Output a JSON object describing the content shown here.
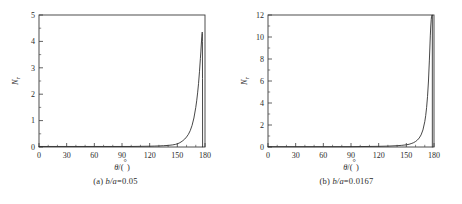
{
  "figure": {
    "background": "#ffffff",
    "line_color": "#262626",
    "axis_color": "#3a3a3a",
    "text_color": "#2b2b2b"
  },
  "panels": [
    {
      "id": "a",
      "caption_prefix": "(a)",
      "caption_expr": "b/a",
      "caption_eq": "=0.05",
      "caption_full": "(a) b/a=0.05"
    },
    {
      "id": "b",
      "caption_prefix": "(b)",
      "caption_expr": "b/a",
      "caption_eq": "=0.0167",
      "caption_full": "(b) b/a=0.0167"
    }
  ],
  "chart_data": [
    {
      "type": "line",
      "panel": "a",
      "title": "(a) b/a=0.05",
      "xlabel": "θ/(°)",
      "ylabel": "N",
      "ylabel_sub": "r",
      "xlim": [
        0,
        180
      ],
      "ylim": [
        0,
        5
      ],
      "xticks": [
        0,
        30,
        60,
        90,
        120,
        150,
        180
      ],
      "xtick_labels": [
        "0",
        "30",
        "60",
        "90",
        "120",
        "150",
        "180"
      ],
      "xminor_step": 10,
      "yticks": [
        0,
        1,
        2,
        3,
        4,
        5
      ],
      "ytick_labels": [
        "0",
        "1",
        "2",
        "3",
        "4",
        "5"
      ],
      "yminor_step": 0.5,
      "grid": false,
      "legend": "none",
      "series": [
        {
          "name": "N_r vs theta (b/a=0.05)",
          "x": [
            0,
            10,
            20,
            30,
            40,
            50,
            60,
            70,
            80,
            90,
            100,
            110,
            120,
            125,
            130,
            135,
            140,
            145,
            148,
            150,
            152,
            154,
            156,
            158,
            160,
            162,
            164,
            166,
            168,
            170,
            171,
            172,
            173,
            174,
            175,
            175.5,
            176,
            176.3,
            176.6,
            176.8,
            177,
            177.1,
            177.2,
            177.3,
            177.4
          ],
          "y": [
            0.02,
            0.02,
            0.02,
            0.02,
            0.02,
            0.02,
            0.02,
            0.02,
            0.02,
            0.02,
            0.02,
            0.025,
            0.03,
            0.035,
            0.04,
            0.05,
            0.06,
            0.08,
            0.1,
            0.12,
            0.15,
            0.19,
            0.24,
            0.3,
            0.38,
            0.48,
            0.62,
            0.82,
            1.1,
            1.5,
            1.75,
            2.05,
            2.4,
            2.85,
            3.35,
            3.6,
            3.9,
            4.05,
            4.2,
            4.3,
            4.35,
            4.3,
            4.0,
            2.6,
            0.0
          ]
        }
      ]
    },
    {
      "type": "line",
      "panel": "b",
      "title": "(b) b/a=0.0167",
      "xlabel": "θ/(°)",
      "ylabel": "N",
      "ylabel_sub": "r",
      "xlim": [
        0,
        180
      ],
      "ylim": [
        0,
        12
      ],
      "xticks": [
        0,
        30,
        60,
        90,
        120,
        150,
        180
      ],
      "xtick_labels": [
        "0",
        "30",
        "60",
        "90",
        "120",
        "150",
        "180"
      ],
      "xminor_step": 10,
      "yticks": [
        0,
        2,
        4,
        6,
        8,
        10,
        12
      ],
      "ytick_labels": [
        "0",
        "2",
        "4",
        "6",
        "8",
        "10",
        "12"
      ],
      "yminor_step": 1,
      "grid": false,
      "legend": "none",
      "series": [
        {
          "name": "N_r vs theta (b/a=0.0167)",
          "x": [
            0,
            10,
            20,
            30,
            40,
            50,
            60,
            70,
            80,
            90,
            100,
            110,
            120,
            130,
            140,
            145,
            150,
            153,
            156,
            158,
            160,
            162,
            164,
            166,
            168,
            170,
            171,
            172,
            173,
            174,
            175,
            175.5,
            176,
            176.5,
            177,
            177.3,
            177.6,
            177.8,
            178,
            178.1,
            178.2
          ],
          "y": [
            0.03,
            0.03,
            0.03,
            0.03,
            0.03,
            0.03,
            0.03,
            0.03,
            0.03,
            0.03,
            0.04,
            0.05,
            0.06,
            0.08,
            0.12,
            0.15,
            0.2,
            0.25,
            0.33,
            0.4,
            0.5,
            0.63,
            0.82,
            1.1,
            1.55,
            2.3,
            2.85,
            3.6,
            4.6,
            6.0,
            7.9,
            9.0,
            10.1,
            11.0,
            11.6,
            11.85,
            11.95,
            12.0,
            12.0,
            12.0,
            12.0
          ]
        }
      ]
    }
  ]
}
